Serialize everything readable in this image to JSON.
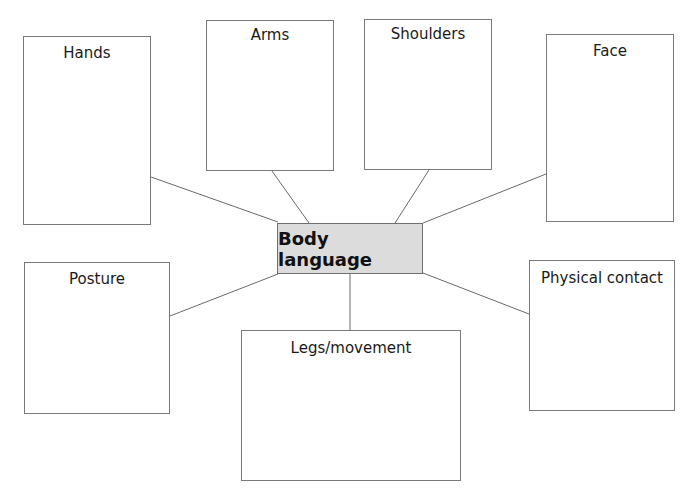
{
  "diagram": {
    "type": "spider-diagram",
    "center": {
      "label": "Body language",
      "fill": "#dcdcdc"
    },
    "branches": [
      {
        "id": "hands",
        "label": "Hands"
      },
      {
        "id": "arms",
        "label": "Arms"
      },
      {
        "id": "shoulders",
        "label": "Shoulders"
      },
      {
        "id": "face",
        "label": "Face"
      },
      {
        "id": "posture",
        "label": "Posture"
      },
      {
        "id": "legs",
        "label": "Legs/movement"
      },
      {
        "id": "physical",
        "label": "Physical contact"
      }
    ],
    "line_color": "#6a6a6a",
    "border_color": "#7a7a7a"
  }
}
